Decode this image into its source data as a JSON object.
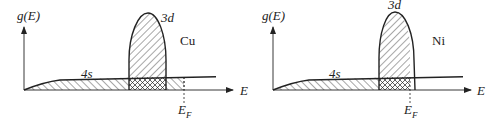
{
  "panels": [
    {
      "metal": "Cu",
      "y_axis_label": "g(E)",
      "x_axis_label": "E",
      "band_4s_label": "4s",
      "band_3d_label": "3d",
      "fermi_label_main": "E",
      "fermi_label_sub": "F",
      "note": "Fermi level lies above the 3d band (3d band fully filled)"
    },
    {
      "metal": "Ni",
      "y_axis_label": "g(E)",
      "x_axis_label": "E",
      "band_4s_label": "4s",
      "band_3d_label": "3d",
      "fermi_label_main": "E",
      "fermi_label_sub": "F",
      "note": "Fermi level lies within the 3d band (3d band partly filled)"
    }
  ],
  "colors": {
    "ink": "#222222",
    "background": "#ffffff"
  }
}
